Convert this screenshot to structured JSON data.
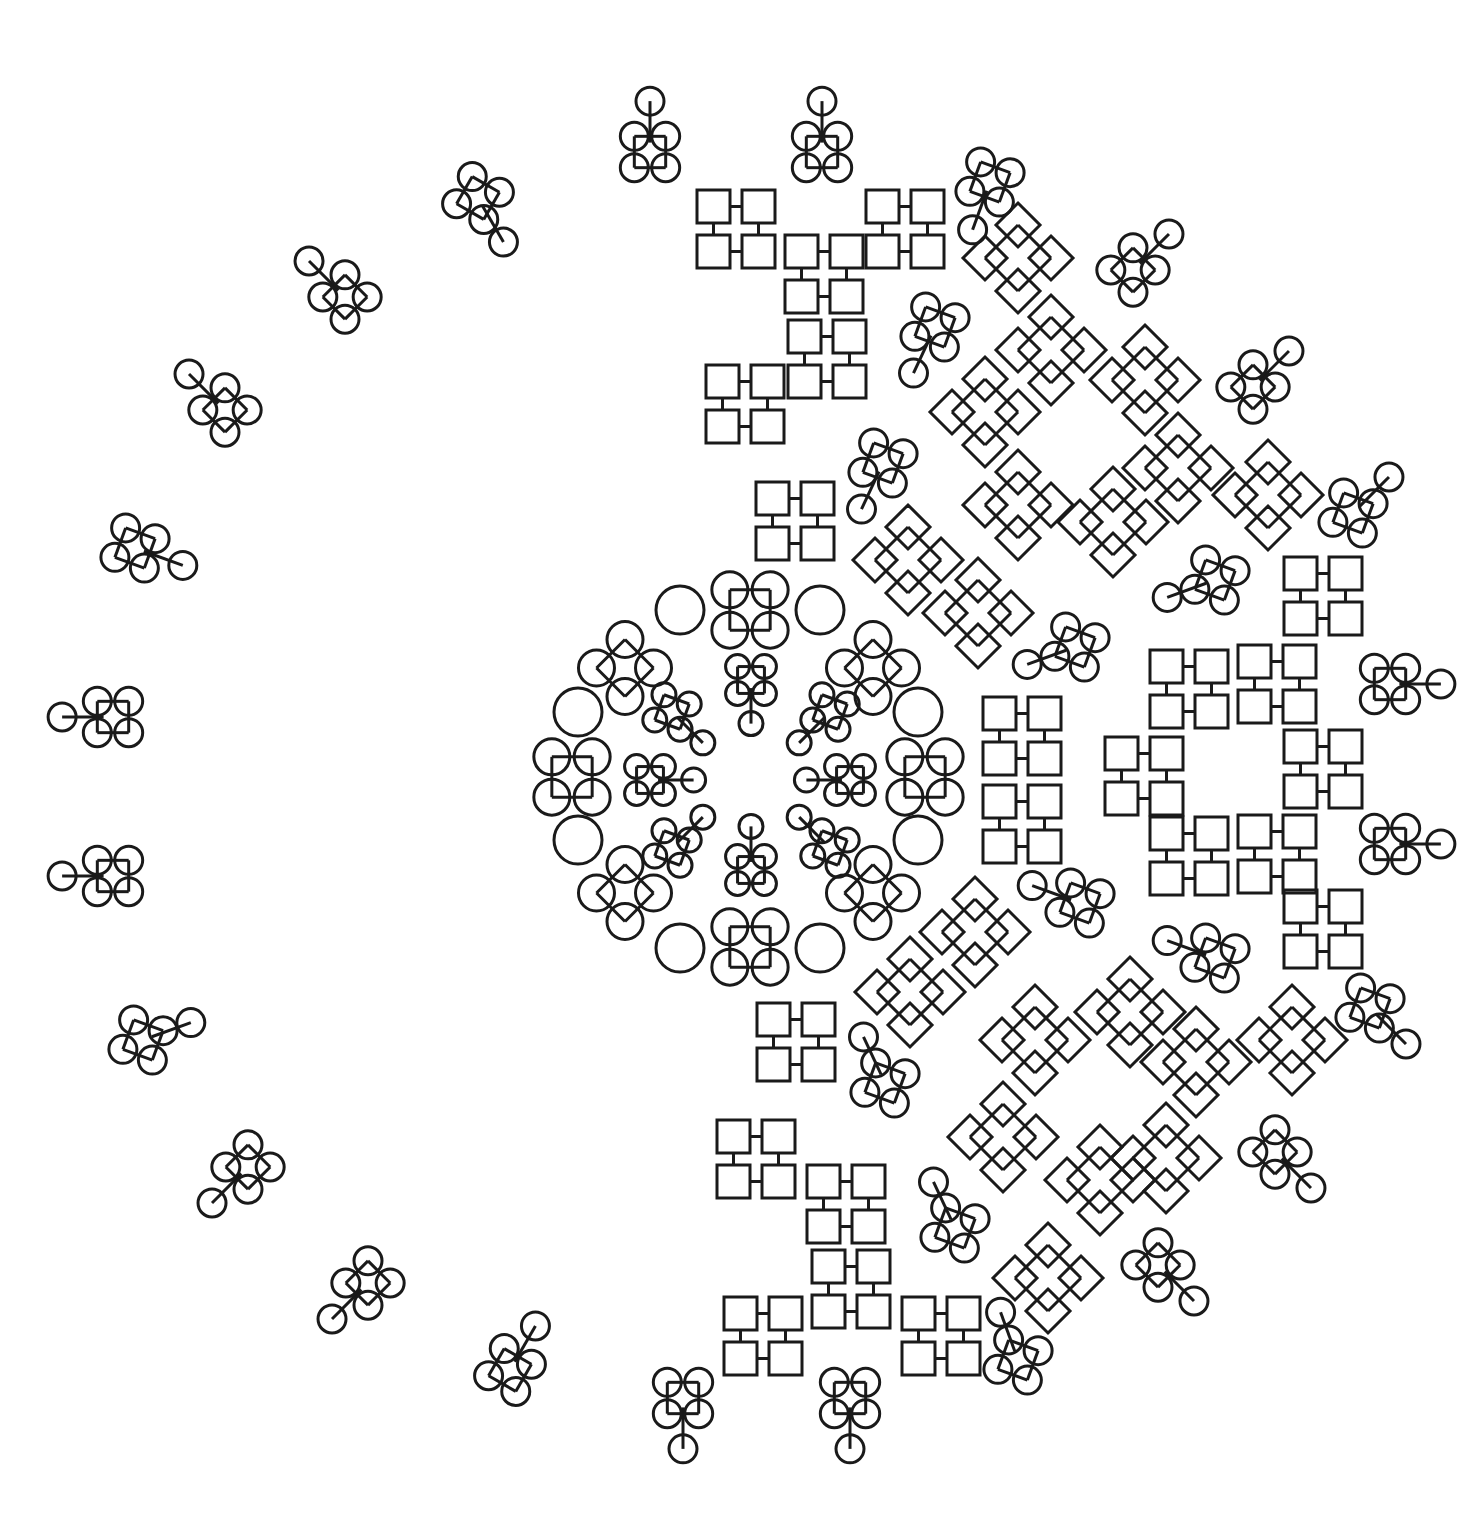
{
  "canvas": {
    "width": 1478,
    "height": 1527,
    "background": "#ffffff",
    "stroke": "#1a1a1a"
  },
  "circle_clusters": [
    {
      "cx": 650,
      "cy": 152,
      "r": 14,
      "rot": 0,
      "spoke": -90
    },
    {
      "cx": 822,
      "cy": 152,
      "r": 14,
      "rot": 0,
      "spoke": -90
    },
    {
      "cx": 478,
      "cy": 198,
      "r": 14,
      "rot": 30,
      "spoke": 60
    },
    {
      "cx": 345,
      "cy": 297,
      "r": 14,
      "rot": 45,
      "spoke": -135
    },
    {
      "cx": 225,
      "cy": 410,
      "r": 14,
      "rot": 45,
      "spoke": -135
    },
    {
      "cx": 135,
      "cy": 548,
      "r": 14,
      "rot": 20,
      "spoke": 20
    },
    {
      "cx": 113,
      "cy": 717,
      "r": 14,
      "rot": 0,
      "spoke": 180
    },
    {
      "cx": 113,
      "cy": 876,
      "r": 14,
      "rot": 0,
      "spoke": 180
    },
    {
      "cx": 143,
      "cy": 1040,
      "r": 14,
      "rot": 20,
      "spoke": -20
    },
    {
      "cx": 248,
      "cy": 1167,
      "r": 14,
      "rot": 45,
      "spoke": 135
    },
    {
      "cx": 368,
      "cy": 1283,
      "r": 14,
      "rot": 45,
      "spoke": 135
    },
    {
      "cx": 510,
      "cy": 1370,
      "r": 14,
      "rot": 30,
      "spoke": -60
    },
    {
      "cx": 683,
      "cy": 1398,
      "r": 14,
      "rot": 0,
      "spoke": 90
    },
    {
      "cx": 850,
      "cy": 1398,
      "r": 14,
      "rot": 0,
      "spoke": 90
    },
    {
      "cx": 990,
      "cy": 182,
      "r": 14,
      "rot": 20,
      "spoke": 110
    },
    {
      "cx": 1133,
      "cy": 270,
      "r": 14,
      "rot": 45,
      "spoke": -45
    },
    {
      "cx": 935,
      "cy": 327,
      "r": 14,
      "rot": 20,
      "spoke": 115
    },
    {
      "cx": 1253,
      "cy": 387,
      "r": 14,
      "rot": 45,
      "spoke": -45
    },
    {
      "cx": 883,
      "cy": 463,
      "r": 14,
      "rot": 20,
      "spoke": 115
    },
    {
      "cx": 1353,
      "cy": 513,
      "r": 14,
      "rot": 20,
      "spoke": -45
    },
    {
      "cx": 1215,
      "cy": 580,
      "r": 14,
      "rot": 20,
      "spoke": 160
    },
    {
      "cx": 1075,
      "cy": 647,
      "r": 14,
      "rot": 20,
      "spoke": 160
    },
    {
      "cx": 1390,
      "cy": 684,
      "r": 14,
      "rot": 0,
      "spoke": 0
    },
    {
      "cx": 1390,
      "cy": 844,
      "r": 14,
      "rot": 0,
      "spoke": 0
    },
    {
      "cx": 1080,
      "cy": 903,
      "r": 14,
      "rot": 20,
      "spoke": -160
    },
    {
      "cx": 1215,
      "cy": 958,
      "r": 14,
      "rot": 20,
      "spoke": -160
    },
    {
      "cx": 1370,
      "cy": 1008,
      "r": 14,
      "rot": 20,
      "spoke": 45
    },
    {
      "cx": 885,
      "cy": 1083,
      "r": 14,
      "rot": 20,
      "spoke": -115
    },
    {
      "cx": 1275,
      "cy": 1152,
      "r": 14,
      "rot": 45,
      "spoke": 45
    },
    {
      "cx": 955,
      "cy": 1228,
      "r": 14,
      "rot": 20,
      "spoke": -115
    },
    {
      "cx": 1158,
      "cy": 1265,
      "r": 14,
      "rot": 45,
      "spoke": 45
    },
    {
      "cx": 1018,
      "cy": 1360,
      "r": 14,
      "rot": 20,
      "spoke": -110
    }
  ],
  "square_clusters": [
    {
      "x": 697,
      "y": 190
    },
    {
      "x": 785,
      "y": 235
    },
    {
      "x": 866,
      "y": 190
    },
    {
      "x": 788,
      "y": 320
    },
    {
      "x": 706,
      "y": 365
    },
    {
      "x": 756,
      "y": 482
    },
    {
      "x": 983,
      "y": 697
    },
    {
      "x": 983,
      "y": 785
    },
    {
      "x": 1105,
      "y": 737
    },
    {
      "x": 1150,
      "y": 650
    },
    {
      "x": 1238,
      "y": 645
    },
    {
      "x": 1284,
      "y": 557
    },
    {
      "x": 1284,
      "y": 730
    },
    {
      "x": 1150,
      "y": 817
    },
    {
      "x": 1238,
      "y": 815
    },
    {
      "x": 1284,
      "y": 890
    },
    {
      "x": 757,
      "y": 1003
    },
    {
      "x": 717,
      "y": 1120
    },
    {
      "x": 807,
      "y": 1165
    },
    {
      "x": 812,
      "y": 1250
    },
    {
      "x": 724,
      "y": 1297
    },
    {
      "x": 902,
      "y": 1297
    }
  ],
  "diamond_clusters": [
    {
      "cx": 1018,
      "cy": 258
    },
    {
      "cx": 1051,
      "cy": 350
    },
    {
      "cx": 985,
      "cy": 412
    },
    {
      "cx": 1145,
      "cy": 380
    },
    {
      "cx": 1018,
      "cy": 505
    },
    {
      "cx": 1113,
      "cy": 522
    },
    {
      "cx": 1178,
      "cy": 468
    },
    {
      "cx": 1268,
      "cy": 495
    },
    {
      "cx": 908,
      "cy": 560
    },
    {
      "cx": 978,
      "cy": 613
    },
    {
      "cx": 910,
      "cy": 992
    },
    {
      "cx": 975,
      "cy": 932
    },
    {
      "cx": 1035,
      "cy": 1040
    },
    {
      "cx": 1130,
      "cy": 1012
    },
    {
      "cx": 1196,
      "cy": 1062
    },
    {
      "cx": 1292,
      "cy": 1040
    },
    {
      "cx": 1003,
      "cy": 1137
    },
    {
      "cx": 1100,
      "cy": 1180
    },
    {
      "cx": 1166,
      "cy": 1158
    },
    {
      "cx": 1048,
      "cy": 1278
    }
  ],
  "center_ring": {
    "big_clusters": [
      {
        "cx": 750,
        "cy": 610,
        "r": 18,
        "rot": 0
      },
      {
        "cx": 873,
        "cy": 668,
        "r": 18,
        "rot": 45
      },
      {
        "cx": 925,
        "cy": 777,
        "r": 18,
        "rot": 0
      },
      {
        "cx": 873,
        "cy": 893,
        "r": 18,
        "rot": 45
      },
      {
        "cx": 750,
        "cy": 947,
        "r": 18,
        "rot": 0
      },
      {
        "cx": 625,
        "cy": 893,
        "r": 18,
        "rot": 45
      },
      {
        "cx": 572,
        "cy": 777,
        "r": 18,
        "rot": 0
      },
      {
        "cx": 625,
        "cy": 668,
        "r": 18,
        "rot": 45
      }
    ],
    "bridges": [
      {
        "cx": 680,
        "cy": 610,
        "r": 18
      },
      {
        "cx": 820,
        "cy": 610,
        "r": 18
      },
      {
        "cx": 918,
        "cy": 712,
        "r": 18
      },
      {
        "cx": 918,
        "cy": 840,
        "r": 18
      },
      {
        "cx": 820,
        "cy": 948,
        "r": 18
      },
      {
        "cx": 680,
        "cy": 948,
        "r": 18
      },
      {
        "cx": 578,
        "cy": 840,
        "r": 18
      },
      {
        "cx": 578,
        "cy": 712,
        "r": 18
      }
    ],
    "inner_clusters": [
      {
        "cx": 751,
        "cy": 680,
        "r": 12,
        "rot": 0,
        "spoke": 90
      },
      {
        "cx": 830,
        "cy": 712,
        "r": 12,
        "rot": 20,
        "spoke": 135
      },
      {
        "cx": 850,
        "cy": 780,
        "r": 12,
        "rot": 0,
        "spoke": 180
      },
      {
        "cx": 830,
        "cy": 848,
        "r": 12,
        "rot": 20,
        "spoke": -135
      },
      {
        "cx": 751,
        "cy": 870,
        "r": 12,
        "rot": 0,
        "spoke": -90
      },
      {
        "cx": 672,
        "cy": 848,
        "r": 12,
        "rot": 20,
        "spoke": -45
      },
      {
        "cx": 650,
        "cy": 780,
        "r": 12,
        "rot": 0,
        "spoke": 0
      },
      {
        "cx": 672,
        "cy": 712,
        "r": 12,
        "rot": 20,
        "spoke": 45
      }
    ]
  }
}
